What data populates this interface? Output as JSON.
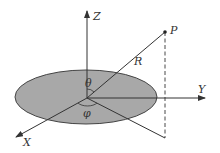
{
  "diagram": {
    "labels": {
      "z_axis": "Z",
      "y_axis": "Y",
      "x_axis": "X",
      "point": "P",
      "radius": "R",
      "polar_angle": "θ",
      "azimuth_angle": "φ"
    },
    "colors": {
      "disk_fill": "#a8a8a8",
      "line": "#333333",
      "background": "#ffffff"
    }
  }
}
